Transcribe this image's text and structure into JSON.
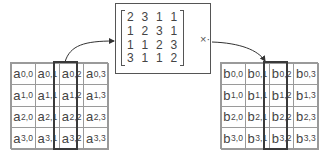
{
  "left_state": {
    "label_prefix": "a",
    "highlighted_column": 2,
    "rows": [
      [
        {
          "b": "a",
          "s": "0,0"
        },
        {
          "b": "a",
          "s": "0,1"
        },
        {
          "b": "a",
          "s": "0,2"
        },
        {
          "b": "a",
          "s": "0,3"
        }
      ],
      [
        {
          "b": "a",
          "s": "1,0"
        },
        {
          "b": "a",
          "s": "1,1"
        },
        {
          "b": "a",
          "s": "1,2"
        },
        {
          "b": "a",
          "s": "1,3"
        }
      ],
      [
        {
          "b": "a",
          "s": "2,0"
        },
        {
          "b": "a",
          "s": "2,1"
        },
        {
          "b": "a",
          "s": "2,2"
        },
        {
          "b": "a",
          "s": "2,3"
        }
      ],
      [
        {
          "b": "a",
          "s": "3,0"
        },
        {
          "b": "a",
          "s": "3,1"
        },
        {
          "b": "a",
          "s": "3,2"
        },
        {
          "b": "a",
          "s": "3,3"
        }
      ]
    ]
  },
  "mix_matrix": {
    "rows": [
      [
        "2",
        "3",
        "1",
        "1"
      ],
      [
        "1",
        "2",
        "3",
        "1"
      ],
      [
        "1",
        "1",
        "2",
        "3"
      ],
      [
        "3",
        "1",
        "1",
        "2"
      ]
    ],
    "operator": "×·"
  },
  "right_state": {
    "label_prefix": "b",
    "highlighted_column": 2,
    "rows": [
      [
        {
          "b": "b",
          "s": "0,0"
        },
        {
          "b": "b",
          "s": "0,1"
        },
        {
          "b": "b",
          "s": "0,2"
        },
        {
          "b": "b",
          "s": "0,3"
        }
      ],
      [
        {
          "b": "b",
          "s": "1,0"
        },
        {
          "b": "b",
          "s": "1,1"
        },
        {
          "b": "b",
          "s": "1,2"
        },
        {
          "b": "b",
          "s": "1,3"
        }
      ],
      [
        {
          "b": "b",
          "s": "2,0"
        },
        {
          "b": "b",
          "s": "2,1"
        },
        {
          "b": "b",
          "s": "2,2"
        },
        {
          "b": "b",
          "s": "2,3"
        }
      ],
      [
        {
          "b": "b",
          "s": "3,0"
        },
        {
          "b": "b",
          "s": "3,1"
        },
        {
          "b": "b",
          "s": "3,2"
        },
        {
          "b": "b",
          "s": "3,3"
        }
      ]
    ]
  }
}
